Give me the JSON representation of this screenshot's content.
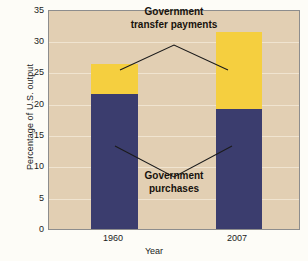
{
  "chart_data": {
    "type": "bar",
    "stacked": true,
    "title": "",
    "xlabel": "Year",
    "ylabel": "Percentage of U.S. output",
    "categories": [
      "1960",
      "2007"
    ],
    "ylim": [
      0,
      35
    ],
    "yticks": [
      0,
      5,
      10,
      15,
      20,
      25,
      30,
      35
    ],
    "ytick_labels": [
      "0",
      "5",
      "10",
      "15",
      "20",
      "25",
      "30",
      "35"
    ],
    "grid": true,
    "legend": "none",
    "series": [
      {
        "name": "Government purchases",
        "color": "#3b3d6e",
        "values": [
          21.7,
          19.2
        ]
      },
      {
        "name": "Government transfer payments",
        "color": "#f5cf3f",
        "values": [
          4.8,
          12.4
        ]
      }
    ],
    "totals": [
      26.5,
      31.6
    ],
    "annotations": [
      {
        "text_line1": "Government",
        "text_line2": "transfer payments",
        "target": "transfers"
      },
      {
        "text_line1": "Government",
        "text_line2": "purchases",
        "target": "purchases"
      }
    ],
    "colors": {
      "plot_background": "#e2cfb3",
      "figure_background": "#fdfcf7",
      "gridline": "#f0e4d0",
      "axis": "#8d8d8d",
      "text": "#1b1b1b",
      "purchases": "#3b3d6e",
      "transfers": "#f5cf3f"
    }
  }
}
